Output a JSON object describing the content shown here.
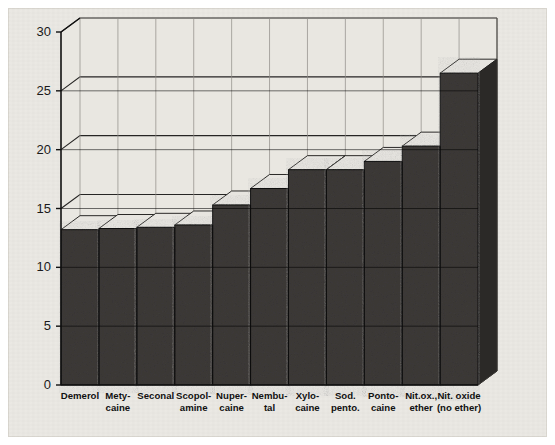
{
  "chart_data": {
    "type": "bar",
    "title": "",
    "subtitle": "",
    "xlabel": "",
    "ylabel": "",
    "ylim": [
      0,
      30
    ],
    "ytick_labels": [
      "0",
      "5",
      "10",
      "15",
      "20",
      "25",
      "30"
    ],
    "yticks": [
      0,
      5,
      10,
      15,
      20,
      25,
      30
    ],
    "grid": true,
    "grid_axis": "y",
    "legend": "none",
    "style": "3d-block-bars-grayscale",
    "categories": [
      "Demerol",
      "Mety-\ncaine",
      "Seconal",
      "Scopol-\namine",
      "Nuper-\ncaine",
      "Nembu-\ntal",
      "Xylo-\ncaine",
      "Sod.\npento.",
      "Ponto-\ncaine",
      "Nit.ox.,\nether",
      "Nit. oxide\n(no ether)"
    ],
    "categories_flat": [
      "Demerol",
      "Metycaine",
      "Seconal",
      "Scopolamine",
      "Nupercaine",
      "Nembutal",
      "Xylocaine",
      "Sod. pento.",
      "Pontocaine",
      "Nit.ox., ether",
      "Nit. oxide (no ether)"
    ],
    "values": [
      13.2,
      13.3,
      13.4,
      13.6,
      15.3,
      16.7,
      18.3,
      18.3,
      19.0,
      20.3,
      26.5
    ]
  },
  "colors": {
    "paper": "#eceae5",
    "bar_front": "#3d3a38",
    "bar_top": "#e7e5e0",
    "bar_side": "#2b2927",
    "axis": "#111111",
    "grid": "#262524",
    "text": "#111111"
  },
  "axis": {
    "y_tick_labels": [
      "30",
      "25",
      "20",
      "15",
      "10",
      "5",
      "0"
    ]
  },
  "caption": {
    "top_mark": ""
  }
}
